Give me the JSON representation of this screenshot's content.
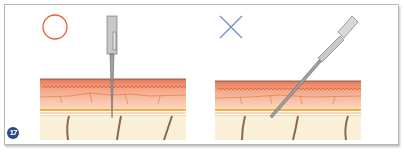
{
  "figure": {
    "number": "17",
    "panels": [
      {
        "id": "correct",
        "symbol": "circle",
        "symbol_color": "#e8603c",
        "description": "needle inserted perpendicular into skin"
      },
      {
        "id": "incorrect",
        "symbol": "cross",
        "symbol_color": "#6a8cc8",
        "description": "needle inserted at an angle into skin"
      }
    ]
  },
  "colors": {
    "epidermis": "#f0a080",
    "dermis": "#f8c8a8",
    "fat_line": "#f0b040",
    "subcutis": "#faf0d8",
    "vessel": "#8a6a50",
    "needle": "#9a9a9a"
  }
}
